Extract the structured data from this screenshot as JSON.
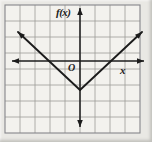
{
  "labels": {
    "y_axis": "f(x)",
    "x_axis": "x",
    "origin": "O"
  },
  "colors": {
    "page_background": "#e9e8e4",
    "paper": "#f3f2ee",
    "grid_line": "#9c9c98",
    "grid_border": "#85858a",
    "ink": "#1c1c1c"
  },
  "figure": {
    "width": 152,
    "height": 142,
    "grid": {
      "x0": 5,
      "y0": 5,
      "cols": 9,
      "rows": 8,
      "cell_w": 15,
      "cell_h": 16
    },
    "x_axis": {
      "y": 61,
      "x1": 12,
      "x2": 144
    },
    "y_axis": {
      "x": 80,
      "y1": 8,
      "y2": 127
    },
    "v_graph": {
      "vertex": [
        80,
        90
      ],
      "left_tip": [
        18,
        32
      ],
      "right_tip": [
        142,
        32
      ]
    }
  },
  "chart_data": {
    "type": "line",
    "title": "",
    "xlabel": "x",
    "ylabel": "f(x)",
    "origin_label": "O",
    "function": "f(x) = |x| - 2",
    "series": [
      {
        "name": "f(x)",
        "points": [
          [
            -4,
            2
          ],
          [
            -3,
            1
          ],
          [
            -2,
            0
          ],
          [
            -1,
            -1
          ],
          [
            0,
            -2
          ],
          [
            1,
            -1
          ],
          [
            2,
            0
          ],
          [
            3,
            1
          ],
          [
            4,
            2
          ]
        ]
      }
    ],
    "vertex": [
      0,
      -2
    ],
    "x_intercepts": [
      -2,
      2
    ],
    "y_intercept": -2,
    "xlim": [
      -5,
      4
    ],
    "ylim": [
      -4.5,
      3.5
    ],
    "grid": true,
    "grid_unit": 1,
    "legend": "none"
  }
}
